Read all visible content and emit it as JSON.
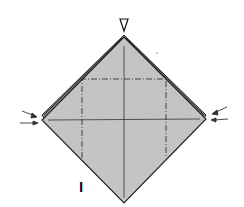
{
  "diagram": {
    "type": "origami-fold-diagram",
    "step_label": "I",
    "colors": {
      "paper_fill": "#c4c4c4",
      "edge": "#222222",
      "background": "#ffffff"
    },
    "markers": {
      "top": "valley-arrow-triangle",
      "left": "push-arrows",
      "right": "push-arrows"
    },
    "fold_lines": {
      "dash_dot": "square-inside-diamond",
      "solid": [
        "vertical-center",
        "horizontal-center"
      ]
    }
  }
}
